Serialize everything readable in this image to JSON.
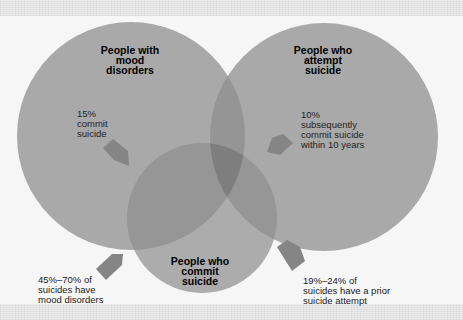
{
  "colors": {
    "background": "#f6f6f6",
    "circle_fill": "#a9a9a9",
    "overlap_two": "#959595",
    "overlap_three": "#7e7e7e",
    "arrow": "#858585"
  },
  "circles": [
    {
      "id": "mood",
      "title": "People with\nmood\ndisorders",
      "cx": 131,
      "cy": 136,
      "r": 114
    },
    {
      "id": "attempt",
      "title": "People who\nattempt\nsuicide",
      "cx": 324,
      "cy": 137,
      "r": 114
    },
    {
      "id": "commit",
      "title": "People who\ncommit\nsuicide",
      "cx": 202,
      "cy": 218,
      "r": 75
    }
  ],
  "annotations": [
    {
      "id": "mood-commit",
      "text": "15%\ncommit\nsuicide"
    },
    {
      "id": "attempt-commit",
      "text": "10%\nsubsequently\ncommit suicide\nwithin 10 years"
    },
    {
      "id": "suicides-mood",
      "text": "45%–70% of\nsuicides have\nmood disorders"
    },
    {
      "id": "suicides-attempt",
      "text": "19%–24% of\nsuicides have a prior\nsuicide attempt"
    }
  ]
}
